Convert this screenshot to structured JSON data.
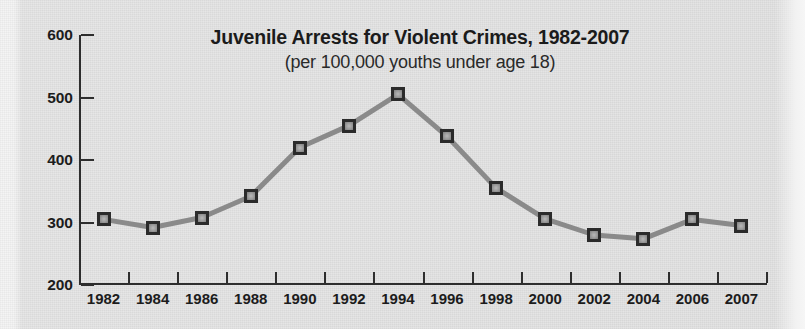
{
  "chart_data": {
    "type": "line",
    "title": "Juvenile Arrests for Violent Crimes, 1982-2007",
    "subtitle": "(per 100,000 youths under age 18)",
    "xlabel": "",
    "ylabel": "",
    "categories": [
      "1982",
      "1984",
      "1986",
      "1988",
      "1990",
      "1992",
      "1994",
      "1996",
      "1998",
      "2000",
      "2002",
      "2004",
      "2006",
      "2007"
    ],
    "values": [
      305,
      292,
      308,
      342,
      420,
      455,
      505,
      438,
      355,
      306,
      280,
      274,
      305,
      295
    ],
    "series": [
      {
        "name": "Juvenile arrest rate for violent crimes",
        "values": [
          305,
          292,
          308,
          342,
          420,
          455,
          505,
          438,
          355,
          306,
          280,
          274,
          305,
          295
        ]
      }
    ],
    "ylim": [
      200,
      600
    ],
    "ytick_labels": [
      "200",
      "300",
      "400",
      "500",
      "600"
    ],
    "ytick_values": [
      200,
      300,
      400,
      500,
      600
    ],
    "grid": false,
    "legend": false,
    "colors": {
      "line": "#8a8a8a",
      "marker_fill": "#9a9a9a",
      "marker_border": "#2b2b2b",
      "axis": "#2e2e2e",
      "text": "#1c1c1c",
      "background": "#e3e3e3"
    }
  }
}
